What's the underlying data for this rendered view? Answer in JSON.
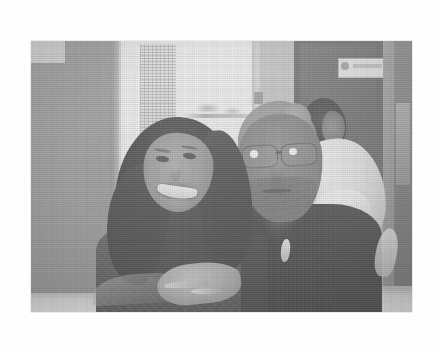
{
  "page": {
    "background_color": "#fefefe",
    "width": 443,
    "height": 355
  },
  "photo": {
    "caption": "",
    "alt_text": "Black and white photograph of a smiling woman with long dark hair leaning against an older man wearing eyeglasses, seated indoors",
    "rendering": "halftone grayscale print",
    "frame": {
      "x": 31,
      "y": 41,
      "width": 381,
      "height": 271
    },
    "colors": {
      "paper": "#fefefe",
      "photo_midtone": "#9a9a9a",
      "highlight": "#f7f7f7",
      "shadow": "#2a2a2a",
      "skin_tone": "#8f8f8f",
      "hair_dark": "#333333",
      "hair_light": "#a8a8a8"
    },
    "subjects": [
      {
        "id": "woman",
        "label": "Woman with long dark hair, smiling",
        "features": [
          "long dark hair",
          "broad smile",
          "patterned dark top"
        ]
      },
      {
        "id": "man",
        "label": "Older man wearing eyeglasses",
        "features": [
          "eyeglasses",
          "light gray hair tied back",
          "beard stubble",
          "dark shirt",
          "pale pendant"
        ]
      },
      {
        "id": "background-person",
        "label": "Person in white shirt in the background",
        "features": [
          "dark hair",
          "white shirt"
        ]
      }
    ],
    "scene_elements": [
      {
        "id": "left-wall",
        "label": "Gray wall pillar at left"
      },
      {
        "id": "bright-window",
        "label": "Bright window opening"
      },
      {
        "id": "curtain",
        "label": "Vertical textured curtain strip"
      },
      {
        "id": "horizon",
        "label": "Faint horizon with distant boats"
      },
      {
        "id": "door-frame",
        "label": "Door frame mullion with latch"
      },
      {
        "id": "dark-doorway",
        "label": "Dark doorway or cabinet at right"
      },
      {
        "id": "door-sign",
        "label": "Small white sign posted on the dark door"
      },
      {
        "id": "table-edge",
        "label": "Light table edge along the bottom"
      },
      {
        "id": "clasped-hands",
        "label": "Clasped hands resting on the table"
      }
    ]
  }
}
